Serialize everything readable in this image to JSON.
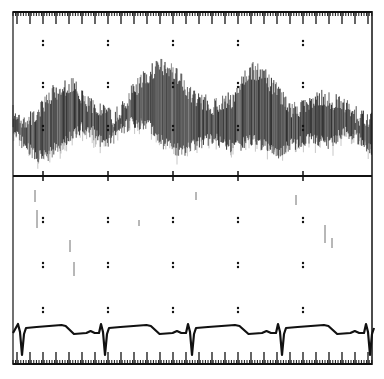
{
  "chart_data": {
    "type": "line",
    "title": "",
    "xlabel": "",
    "ylabel": "",
    "grid": "dotted markers",
    "legend": "none",
    "panels": [
      {
        "name": "doppler-spectrogram",
        "type": "area",
        "description": "Spectral Doppler velocity envelope (dark band) over time",
        "x": [
          0,
          10,
          20,
          30,
          40,
          50,
          60,
          70,
          80,
          90,
          100,
          110,
          120,
          130,
          140,
          150,
          160,
          170,
          180,
          190,
          200,
          210,
          220,
          230,
          240,
          250,
          260,
          270,
          280,
          290,
          300,
          310,
          320,
          330,
          340,
          350,
          359
        ],
        "upper": [
          105,
          112,
          108,
          95,
          85,
          80,
          75,
          90,
          100,
          100,
          110,
          100,
          82,
          70,
          62,
          58,
          64,
          75,
          88,
          92,
          98,
          95,
          90,
          68,
          62,
          64,
          78,
          90,
          102,
          100,
          92,
          88,
          92,
          96,
          104,
          110,
          112
        ],
        "lower": [
          140,
          150,
          160,
          165,
          158,
          150,
          140,
          135,
          140,
          150,
          145,
          135,
          130,
          130,
          135,
          150,
          155,
          158,
          152,
          148,
          145,
          150,
          155,
          150,
          145,
          152,
          160,
          158,
          150,
          150,
          145,
          150,
          148,
          140,
          140,
          150,
          158
        ]
      },
      {
        "name": "ecg",
        "type": "line",
        "description": "ECG trace with QRS complexes",
        "qrs_x": [
          20,
          103,
          190,
          280,
          368
        ],
        "baseline_y": 330
      }
    ],
    "grid_columns_x": [
      43,
      108,
      173,
      238,
      303
    ],
    "grid_rows_top_y": [
      43,
      85,
      128
    ],
    "grid_rows_bottom_y": [
      220,
      265,
      310
    ]
  },
  "colors": {
    "ink": "#111111",
    "paper": "#ffffff"
  }
}
